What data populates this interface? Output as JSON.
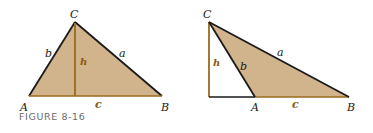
{
  "caption": "FIGURE 8-16",
  "colors": {
    "fill": "#d2b48c",
    "altitude": "#9a6a1e",
    "edge": "#1a1a1a"
  },
  "left_figure": {
    "vertices": {
      "A": "A",
      "B": "B",
      "C": "C"
    },
    "sides": {
      "a": "a",
      "b": "b",
      "c": "c"
    },
    "altitude": "h"
  },
  "right_figure": {
    "vertices": {
      "A": "A",
      "B": "B",
      "C": "C"
    },
    "sides": {
      "a": "a",
      "b": "b",
      "c": "c"
    },
    "altitude": "h"
  }
}
